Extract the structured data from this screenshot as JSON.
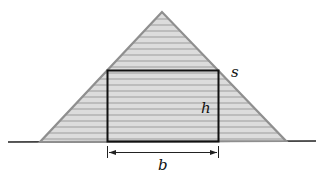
{
  "diagram": {
    "labels": {
      "slant_side": "s",
      "height": "h",
      "base": "b"
    },
    "colors": {
      "fill": "#d4d4d4",
      "stripe": "#bdbdbd",
      "outline": "#8a8a8a",
      "rect": "#111111"
    }
  }
}
